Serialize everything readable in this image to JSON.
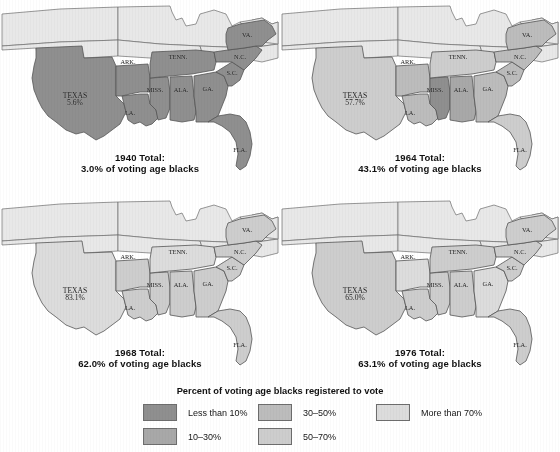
{
  "figure": {
    "legend_title": "Percent of voting age blacks registered to vote",
    "background": "#ffffff"
  },
  "palette": {
    "lt10": "#8f8f8f",
    "p10_30": "#a8a8a8",
    "p30_50": "#bcbcbc",
    "p50_70": "#cdcdcd",
    "gt70": "#dcdcdc",
    "nondata": "#e8e8e8",
    "outline": "#6d6d6d"
  },
  "legend": {
    "items": [
      {
        "label": "Less than 10%",
        "color_key": "lt10",
        "color": "#8f8f8f"
      },
      {
        "label": "10–30%",
        "color_key": "p10_30",
        "color": "#a8a8a8"
      },
      {
        "label": "30–50%",
        "color_key": "p30_50",
        "color": "#bcbcbc"
      },
      {
        "label": "50–70%",
        "color_key": "p50_70",
        "color": "#cdcdcd"
      },
      {
        "label": "More than 70%",
        "color_key": "gt70",
        "color": "#dcdcdc"
      }
    ]
  },
  "chart_data": {
    "type": "map",
    "title": "Percent of voting age blacks registered to vote",
    "unit": "percent",
    "bins": [
      "Less than 10%",
      "10–30%",
      "30–50%",
      "50–70%",
      "More than 70%"
    ],
    "states": [
      "TEXAS",
      "ARK.",
      "LA.",
      "MISS.",
      "ALA.",
      "TENN.",
      "GA.",
      "FLA.",
      "S.C.",
      "N.C.",
      "VA."
    ],
    "panels": [
      {
        "year": "1940",
        "title_line1": "1940 Total:",
        "title_line2": "3.0% of voting age blacks",
        "total": 3.0,
        "values": {
          "TEXAS": 5.6,
          "ARK.": 1.5,
          "LA.": 0.5,
          "MISS.": 0.4,
          "ALA.": 0.4,
          "TENN.": 6.5,
          "GA.": 3.0,
          "FLA.": 5.7,
          "S.C.": 0.8,
          "N.C.": 7.1,
          "VA.": 4.1
        },
        "labels": {
          "TEXAS": "5.6%",
          "ARK.": "1.5%",
          "LA.": "0.5%",
          "MISS.": "0.4%",
          "ALA.": "0.4%",
          "TENN.": "6.5%",
          "GA.": "3.0%",
          "FLA.": "5.7%",
          "S.C.": "0.8%",
          "N.C.": "7.1%",
          "VA.": "4.1%"
        }
      },
      {
        "year": "1964",
        "title_line1": "1964 Total:",
        "title_line2": "43.1% of voting age blacks",
        "total": 43.1,
        "values": {
          "TEXAS": 57.7,
          "ARK.": 49.3,
          "LA.": 32.0,
          "MISS.": 6.7,
          "ALA.": 23.0,
          "TENN.": 69.4,
          "GA.": 44.0,
          "FLA.": 63.8,
          "S.C.": 38.7,
          "N.C.": 46.8,
          "VA.": 45.7
        },
        "labels": {
          "TEXAS": "57.7%",
          "ARK.": "49.3%",
          "LA.": "32.0%",
          "MISS.": "6.7%",
          "ALA.": "23.0%",
          "TENN.": "69.4%",
          "GA.": "44.0%",
          "FLA.": "63.8%",
          "S.C.": "38.7%",
          "N.C.": "46.8%",
          "VA.": "45.7%"
        }
      },
      {
        "year": "1968",
        "title_line1": "1968 Total:",
        "title_line2": "62.0% of voting age blacks",
        "total": 62.0,
        "values": {
          "TEXAS": 83.1,
          "ARK.": 67.5,
          "LA.": 59.3,
          "MISS.": 54.4,
          "ALA.": 56.7,
          "TENN.": 72.8,
          "GA.": 56.1,
          "FLA.": 62.1,
          "S.C.": 50.8,
          "N.C.": 55.3,
          "VA.": 58.4
        },
        "labels": {
          "TEXAS": "83.1%",
          "ARK.": "67.5%",
          "LA.": "59.3%",
          "MISS.": "54.4%",
          "ALA.": "56.7%",
          "TENN.": "72.8%",
          "GA.": "56.1%",
          "FLA.": "62.1%",
          "S.C.": "50.8%",
          "N.C.": "55.3%",
          "VA.": "58.4%"
        }
      },
      {
        "year": "1976",
        "title_line1": "1976 Total:",
        "title_line2": "63.1% of voting age blacks",
        "total": 63.1,
        "values": {
          "TEXAS": 65.0,
          "ARK.": 94.0,
          "LA.": 63.0,
          "MISS.": 60.7,
          "ALA.": 58.4,
          "TENN.": 66.4,
          "GA.": 74.8,
          "FLA.": 61.1,
          "S.C.": 56.5,
          "N.C.": 54.8,
          "VA.": 54.7
        },
        "labels": {
          "TEXAS": "65.0%",
          "ARK.": "94.0%",
          "LA.": "63.0%",
          "MISS.": "60.7%",
          "ALA.": "58.4%",
          "TENN.": "66.4%",
          "GA.": "74.8%",
          "FLA.": "61.1%",
          "S.C.": "56.5%",
          "N.C.": "54.8%",
          "VA.": "54.7%"
        }
      }
    ]
  },
  "geometry": {
    "panel_origins": [
      {
        "x": 0,
        "y": 0
      },
      {
        "x": 280,
        "y": 0
      },
      {
        "x": 0,
        "y": 195
      },
      {
        "x": 280,
        "y": 195
      }
    ],
    "title_top": 152,
    "label_positions": {
      "TEXAS": {
        "x": 75,
        "y": 100
      },
      "ARK.": {
        "x": 128,
        "y": 62
      },
      "LA.": {
        "x": 130,
        "y": 113
      },
      "MISS.": {
        "x": 155,
        "y": 90
      },
      "ALA.": {
        "x": 181,
        "y": 90
      },
      "TENN.": {
        "x": 178,
        "y": 57
      },
      "GA.": {
        "x": 208,
        "y": 89
      },
      "FLA.": {
        "x": 240,
        "y": 150
      },
      "S.C.": {
        "x": 232,
        "y": 73
      },
      "N.C.": {
        "x": 240,
        "y": 57
      },
      "VA.": {
        "x": 247,
        "y": 35
      }
    }
  }
}
